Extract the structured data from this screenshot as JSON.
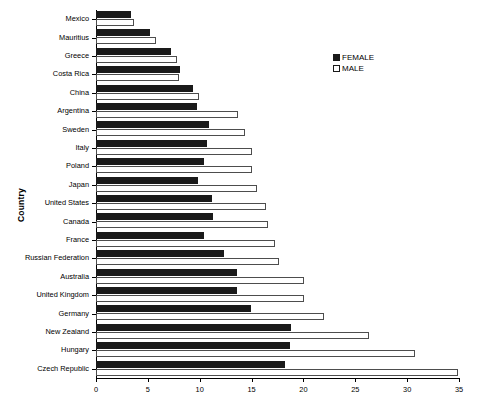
{
  "chart_data": {
    "type": "bar",
    "orientation": "horizontal",
    "title": "",
    "xlabel": "",
    "ylabel": "Country",
    "xlim": [
      0,
      35
    ],
    "xticks": [
      0,
      5,
      10,
      15,
      20,
      25,
      30,
      35
    ],
    "grid": false,
    "legend_position": "top-right",
    "categories": [
      "Mexico",
      "Mauritius",
      "Greece",
      "Costa Rica",
      "China",
      "Argentina",
      "Sweden",
      "Italy",
      "Poland",
      "Japan",
      "United States",
      "Canada",
      "France",
      "Russian Federation",
      "Australia",
      "United Kingdom",
      "Germany",
      "New Zealand",
      "Hungary",
      "Czech Republic"
    ],
    "series": [
      {
        "name": "FEMALE",
        "color": "#1a1a1a",
        "values": [
          3.4,
          5.2,
          7.2,
          8.1,
          9.4,
          9.7,
          10.9,
          10.7,
          10.4,
          9.8,
          11.2,
          11.3,
          10.4,
          12.3,
          13.6,
          13.6,
          14.9,
          18.8,
          18.7,
          18.2
        ]
      },
      {
        "name": "MALE",
        "color": "#ffffff",
        "values": [
          3.7,
          5.8,
          7.8,
          8.0,
          9.9,
          13.7,
          14.4,
          15.0,
          15.0,
          15.5,
          16.4,
          16.6,
          17.3,
          17.6,
          20.1,
          20.1,
          22.0,
          26.3,
          30.8,
          34.9
        ]
      }
    ]
  },
  "legend": {
    "items": [
      {
        "label": "FEMALE",
        "swatch": "filled-black-square"
      },
      {
        "label": "MALE",
        "swatch": "open-white-square"
      }
    ]
  },
  "axes": {
    "y_title": "Country"
  }
}
